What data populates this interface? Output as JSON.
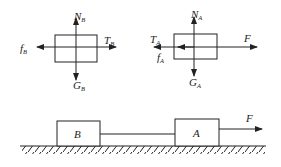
{
  "diagram": {
    "title": "",
    "fbd_b": {
      "labels": {
        "normal": {
          "main": "N",
          "sub": "B"
        },
        "tension": {
          "main": "T",
          "sub": "B"
        },
        "friction": {
          "main": "f",
          "sub": "B"
        },
        "gravity": {
          "main": "G",
          "sub": "B"
        }
      }
    },
    "fbd_a": {
      "labels": {
        "normal": {
          "main": "N",
          "sub": "A"
        },
        "tension": {
          "main": "T",
          "sub": "A"
        },
        "friction": {
          "main": "f",
          "sub": "A"
        },
        "gravity": {
          "main": "G",
          "sub": "A"
        },
        "applied": {
          "main": "F"
        }
      }
    },
    "scene": {
      "block_b": "B",
      "block_a": "A",
      "force": "F"
    },
    "colors": {
      "stroke": "#222222",
      "background": "#ffffff"
    }
  }
}
